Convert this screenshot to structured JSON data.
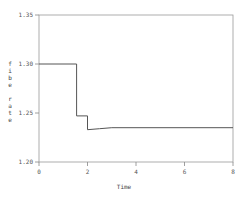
{
  "chart_data": {
    "type": "line",
    "title": "",
    "xlabel": "Time",
    "ylabel": "fibe rate",
    "xlim": [
      0,
      8
    ],
    "ylim": [
      1.2,
      1.35
    ],
    "xticks": [
      "0",
      "2",
      "4",
      "6",
      "8"
    ],
    "yticks": [
      "1.20",
      "1.25",
      "1.30",
      "1.35"
    ],
    "grid": false,
    "legend": null,
    "series": [
      {
        "name": "fibe rate",
        "step": true,
        "x": [
          0,
          1.55,
          1.55,
          2.0,
          2.0,
          2.5,
          3.0,
          8.0
        ],
        "y": [
          1.3,
          1.3,
          1.247,
          1.247,
          1.233,
          1.234,
          1.235,
          1.235
        ]
      }
    ]
  },
  "axes": {
    "xlabel": "Time",
    "ylabel_chars": [
      "f",
      "i",
      "b",
      "e",
      " ",
      "r",
      "a",
      "t",
      "e"
    ],
    "xticks": [
      "0",
      "2",
      "4",
      "6",
      "8"
    ],
    "yticks": [
      "1.20",
      "1.25",
      "1.30",
      "1.35"
    ]
  }
}
